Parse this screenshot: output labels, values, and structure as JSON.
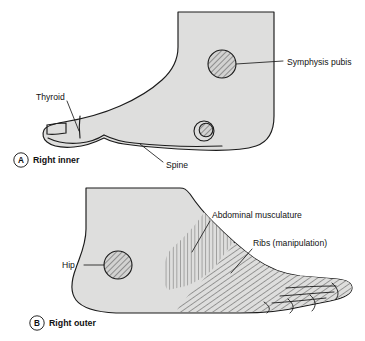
{
  "figure": {
    "background_color": "#ffffff",
    "foot_fill_color": "#dededd",
    "outline_color": "#1b1b1b"
  },
  "panels": [
    {
      "id": "A",
      "letter": "A",
      "caption": "Right inner",
      "view": "medial",
      "labels": [
        {
          "id": "symphysis-pubis",
          "text": "Symphysis pubis",
          "marker_type": "hatched-circle",
          "hatch": "diagonal",
          "marker_cx": 222,
          "marker_cy": 64,
          "marker_r": 14,
          "text_x": 287,
          "text_y": 62,
          "leader": "M 236 64 L 283 61"
        },
        {
          "id": "thyroid",
          "text": "Thyroid",
          "marker_type": "leader-only",
          "text_x": 36,
          "text_y": 97,
          "leader": "M 67 101 L 79 131"
        },
        {
          "id": "spine",
          "text": "Spine",
          "marker_type": "leader-only",
          "text_x": 166,
          "text_y": 165,
          "leader": "M 163 162 L 140 144"
        }
      ]
    },
    {
      "id": "B",
      "letter": "B",
      "caption": "Right outer",
      "view": "lateral",
      "labels": [
        {
          "id": "hip",
          "text": "Hip",
          "marker_type": "hatched-circle",
          "hatch": "diagonal",
          "marker_cx": 118,
          "marker_cy": 265,
          "marker_r": 14,
          "text_x": 62,
          "text_y": 268,
          "leader": "M 84 265 L 104 265"
        },
        {
          "id": "abdominal-musculature",
          "text": "Abdominal musculature",
          "marker_type": "hatched-region",
          "hatch": "vertical",
          "text_x": 212,
          "text_y": 216,
          "leader": "M 210 221 L 192 252"
        },
        {
          "id": "ribs-manipulation",
          "text": "Ribs (manipulation)",
          "marker_type": "hatched-region",
          "hatch": "diagonal",
          "text_x": 253,
          "text_y": 244,
          "leader": "M 252 249 L 231 273"
        }
      ]
    }
  ]
}
